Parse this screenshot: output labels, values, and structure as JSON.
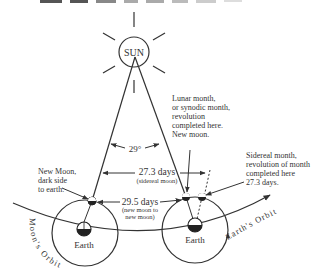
{
  "title_fragment": "LUNAR MONTH",
  "sun": {
    "label": "SUN"
  },
  "angle": {
    "label": "29°"
  },
  "sidereal_span": {
    "label": "27.3 days",
    "sub": "(sidereal moon)"
  },
  "synodic_span": {
    "label": "29.5 days",
    "sub1": "(new moon to",
    "sub2": "new moon)"
  },
  "notes": {
    "new_moon": [
      "New Moon,",
      "dark side",
      "to earth."
    ],
    "lunar_month": [
      "Lunar month,",
      "or synodic month,",
      "revolution",
      "completed here.",
      "New moon."
    ],
    "sidereal_month": [
      "Sidereal month,",
      "revolution of month",
      "completed here",
      "27.3 days."
    ]
  },
  "earth_left": {
    "label": "Earth"
  },
  "earth_right": {
    "label": "Earth"
  },
  "orbits": {
    "moon": "Moon's Orbit",
    "earth": "Earth's Orbit"
  },
  "colors": {
    "ink": "#333333",
    "background": "#ffffff"
  }
}
